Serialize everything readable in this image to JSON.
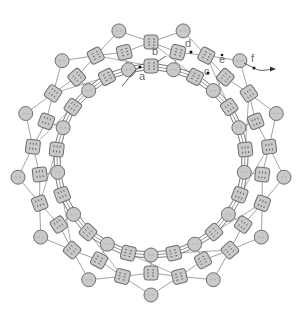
{
  "diagram": {
    "type": "ring-network",
    "center": [
      151,
      161
    ],
    "segments": 13,
    "layers": {
      "outer_circles": {
        "shape": "circle",
        "count": 13,
        "radius": 134,
        "size": 14
      },
      "middle_squares": {
        "shape": "square",
        "count": 26,
        "radius_even": 112,
        "radius_odd": 119,
        "size": 14
      },
      "inner_chain": {
        "shape": "alternating circle/square",
        "count": 26,
        "radius_circle": 94,
        "radius_square": 95,
        "size": 14
      }
    },
    "colors": {
      "fill": "#c9c9c9",
      "stroke": "#6e6e6e",
      "line": "#8a8a8a",
      "chain_line": "#555555",
      "label": "#6a6a6a"
    },
    "labels": [
      {
        "text": "a",
        "x": 139,
        "y": 80
      },
      {
        "text": "b",
        "x": 152,
        "y": 55
      },
      {
        "text": "c",
        "x": 204,
        "y": 75
      },
      {
        "text": "d",
        "x": 185,
        "y": 47
      },
      {
        "text": "e",
        "x": 219,
        "y": 63
      },
      {
        "text": "f",
        "x": 251,
        "y": 62
      }
    ]
  }
}
